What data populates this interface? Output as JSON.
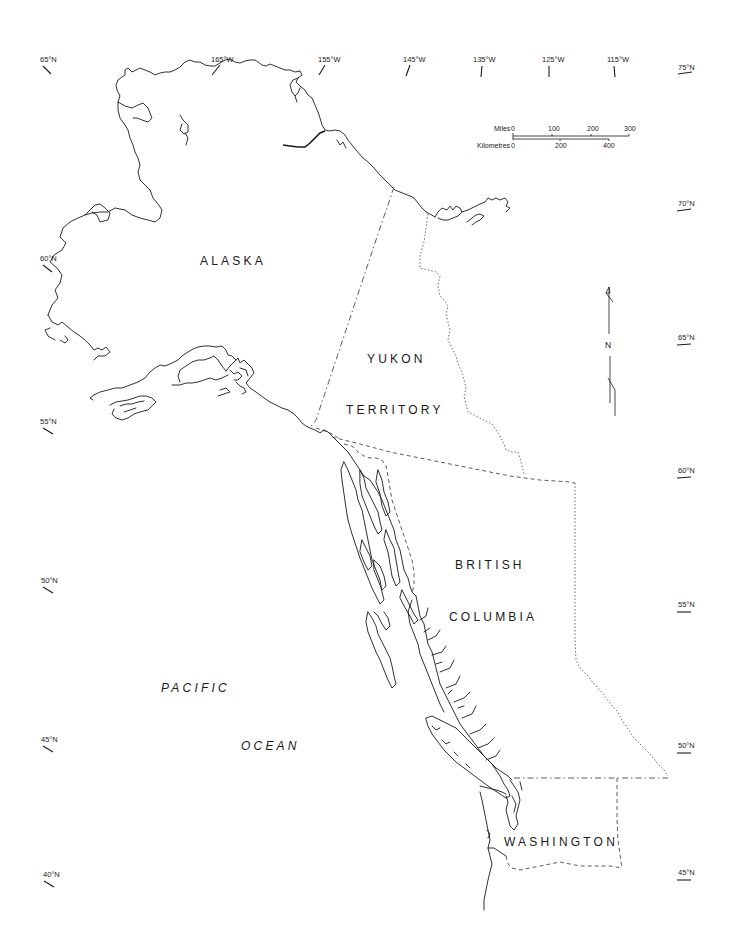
{
  "map": {
    "type": "outline-map",
    "region": "Northwestern North America",
    "regions": [
      {
        "id": "alaska",
        "label": "ALASKA",
        "x": 237,
        "y": 265
      },
      {
        "id": "yukon-1",
        "label": "YUKON",
        "x": 391,
        "y": 363
      },
      {
        "id": "yukon-2",
        "label": "TERRITORY",
        "x": 391,
        "y": 414
      },
      {
        "id": "bc-1",
        "label": "BRITISH",
        "x": 459,
        "y": 569
      },
      {
        "id": "bc-2",
        "label": "COLUMBIA",
        "x": 489,
        "y": 621
      },
      {
        "id": "washington",
        "label": "WASHINGTON",
        "x": 557,
        "y": 846
      }
    ],
    "water_labels": [
      {
        "id": "pacific",
        "label": "PACIFIC",
        "x": 193,
        "y": 692
      },
      {
        "id": "ocean",
        "label": "OCEAN",
        "x": 267,
        "y": 750
      }
    ],
    "longitude_labels": [
      {
        "label": "165°W",
        "x": 219,
        "y": 61
      },
      {
        "label": "155°W",
        "x": 326,
        "y": 61
      },
      {
        "label": "145°W",
        "x": 414,
        "y": 61
      },
      {
        "label": "135°W",
        "x": 482,
        "y": 61
      },
      {
        "label": "125°W",
        "x": 549,
        "y": 61
      },
      {
        "label": "115°W",
        "x": 615,
        "y": 61
      }
    ],
    "latitude_labels_left": [
      {
        "label": "65°N",
        "x": 48,
        "y": 62
      },
      {
        "label": "60°N",
        "x": 48,
        "y": 261
      },
      {
        "label": "55°N",
        "x": 48,
        "y": 424
      },
      {
        "label": "50°N",
        "x": 48,
        "y": 583
      },
      {
        "label": "45°N",
        "x": 48,
        "y": 742
      },
      {
        "label": "40°N",
        "x": 48,
        "y": 877
      }
    ],
    "latitude_labels_right": [
      {
        "label": "75°N",
        "x": 685,
        "y": 70
      },
      {
        "label": "70°N",
        "x": 685,
        "y": 206
      },
      {
        "label": "65°N",
        "x": 685,
        "y": 340
      },
      {
        "label": "60°N",
        "x": 685,
        "y": 473
      },
      {
        "label": "55°N",
        "x": 685,
        "y": 607
      },
      {
        "label": "50°N",
        "x": 685,
        "y": 748
      },
      {
        "label": "45°N",
        "x": 685,
        "y": 875
      }
    ],
    "scale_bar": {
      "miles_label": "Miles",
      "miles_ticks": [
        "0",
        "100",
        "200",
        "300"
      ],
      "km_label": "Kilometres",
      "km_ticks": [
        "0",
        "200",
        "400"
      ]
    },
    "north_arrow": {
      "label": "N"
    },
    "colors": {
      "background": "#ffffff",
      "ink": "#1a1a1a"
    }
  }
}
